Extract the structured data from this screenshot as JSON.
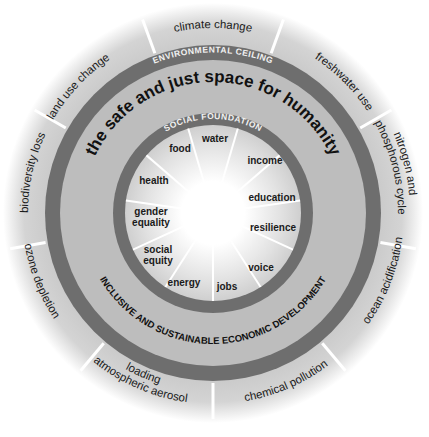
{
  "diagram": {
    "title": "the safe and just space for humanity",
    "environmental_ceiling_label": "ENVIRONMENTAL CEILING",
    "social_foundation_label": "SOCIAL FOUNDATION",
    "economic_label": "INCLUSIVE AND SUSTAINABLE ECONOMIC DEVELOPMENT",
    "planetary_boundaries": [
      {
        "label": "climate change"
      },
      {
        "label": "freshwater use"
      },
      {
        "label": "nitrogen and",
        "label2": "phosphorous cycle"
      },
      {
        "label": "ocean acidification"
      },
      {
        "label": "chemical pollution"
      },
      {
        "label": "atmospheric aerosol",
        "label2": "loading"
      },
      {
        "label": "ozone depletion"
      },
      {
        "label": "biodiversity loss"
      },
      {
        "label": "land use change"
      }
    ],
    "social_foundation": [
      {
        "label": "water"
      },
      {
        "label": "income"
      },
      {
        "label": "education"
      },
      {
        "label": "resilience"
      },
      {
        "label": "voice"
      },
      {
        "label": "jobs"
      },
      {
        "label": "energy"
      },
      {
        "label": "social",
        "label2": "equity"
      },
      {
        "label": "gender",
        "label2": "equality"
      },
      {
        "label": "health"
      },
      {
        "label": "food"
      }
    ],
    "colors": {
      "band": "#6e6e6e",
      "ring_fill": "#bdbdbd",
      "outer_fill": "#cfcfcf",
      "center": "#ffffff",
      "text": "#1a1a1a"
    }
  }
}
